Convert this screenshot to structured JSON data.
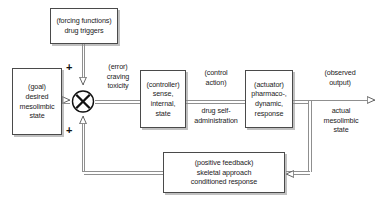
{
  "diagram": {
    "background_color": "#ffffff",
    "line_color": "#8a8a8a",
    "box_border_color": "#4a4a4a",
    "text_color": "#1b1b1b",
    "blocks": [
      {
        "id": "forcing-functions",
        "role": "disturbance-input",
        "lines": [
          "(forcing functions)",
          "drug triggers"
        ]
      },
      {
        "id": "goal",
        "role": "reference-input",
        "lines": [
          "(goal)",
          "desired",
          "mesolimbic",
          "state"
        ]
      },
      {
        "id": "controller",
        "role": "controller",
        "lines": [
          "(controller)",
          "sense,",
          "internal,",
          "state"
        ]
      },
      {
        "id": "actuator",
        "role": "actuator",
        "lines": [
          "(actuator)",
          "pharmaco-,",
          "dynamic,",
          "response"
        ]
      },
      {
        "id": "positive-feedback",
        "role": "feedback-path",
        "lines": [
          "(positive feedback)",
          "skeletal approach",
          "conditioned response"
        ]
      }
    ],
    "signal_labels": [
      {
        "id": "error-signal",
        "lines": [
          "(error)",
          "craving",
          "toxicity"
        ]
      },
      {
        "id": "control-action-signal",
        "lines": [
          "(control",
          "action)"
        ]
      },
      {
        "id": "drug-self-administration-signal",
        "lines": [
          "drug self-",
          "administration"
        ]
      },
      {
        "id": "observed-output-signal",
        "lines": [
          "(observed",
          "output)"
        ]
      },
      {
        "id": "actual-state-signal",
        "lines": [
          "actual",
          "mesolimbic",
          "state"
        ]
      }
    ],
    "summing_junction": {
      "id": "summing-junction",
      "symbol": "circle-with-x",
      "sign_top": "+",
      "sign_bottom": "+"
    }
  }
}
